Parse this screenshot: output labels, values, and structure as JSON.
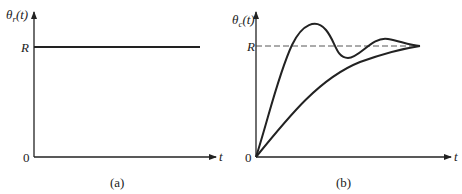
{
  "figure": {
    "panels": [
      {
        "id": "a",
        "caption": "(a)",
        "y_label_main": "θ",
        "y_label_sub": "r",
        "y_label_arg": "(t)",
        "x_label": "t",
        "level_label": "R",
        "origin_label": "0",
        "description": "Step reference input θr(t) = R for t ≥ 0"
      },
      {
        "id": "b",
        "caption": "(b)",
        "y_label_main": "θ",
        "y_label_sub": "c",
        "y_label_arg": "(t)",
        "x_label": "t",
        "level_label": "R",
        "origin_label": "0",
        "description": "Output responses θc(t): underdamped oscillatory response and overdamped smooth response, both settling to R (dashed reference line)"
      }
    ]
  }
}
